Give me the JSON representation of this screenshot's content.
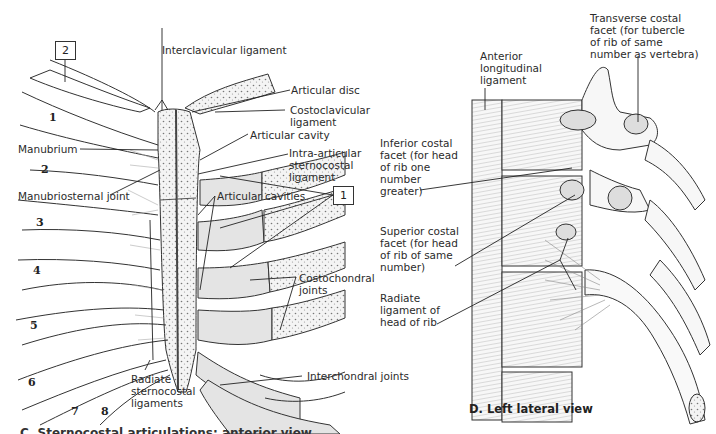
{
  "figure": {
    "left_panel": {
      "boxes": [
        {
          "id": "box-2",
          "text": "2"
        },
        {
          "id": "box-1",
          "text": "1"
        }
      ],
      "rib_numbers": [
        "1",
        "2",
        "3",
        "4",
        "5",
        "6",
        "7",
        "8"
      ],
      "labels": {
        "interclavicular_ligament": "Interclavicular ligament",
        "articular_disc": "Articular disc",
        "costoclavicular_ligament": [
          "Costoclavicular",
          "ligament"
        ],
        "articular_cavity": "Articular cavity",
        "intra_articular_ligament": [
          "Intra-articular",
          "sternocostal",
          "ligament"
        ],
        "manubrium": "Manubrium",
        "manubriosternal_joint": "Manubriosternal joint",
        "articular_cavities": "Articular cavities",
        "costochondral_joints": [
          "Costochondral",
          "joints"
        ],
        "radiate_sternocostal_ligaments": [
          "Radiate",
          "sternocostal",
          "ligaments"
        ],
        "interchondral_joints": "Interchondral joints"
      },
      "caption_clipped": "C. Sternocostal articulations: anterior view"
    },
    "right_panel": {
      "labels": {
        "transverse_costal_facet": [
          "Transverse costal",
          "facet (for tubercle",
          "of rib of same",
          "number as vertebra)"
        ],
        "anterior_longitudinal_ligament": [
          "Anterior",
          "longitudinal",
          "ligament"
        ],
        "inferior_costal_facet": [
          "Inferior costal",
          "facet (for head",
          "of rib one",
          "number",
          "greater)"
        ],
        "superior_costal_facet": [
          "Superior costal",
          "facet (for head",
          "of rib of same",
          "number)"
        ],
        "radiate_ligament": [
          "Radiate",
          "ligament of",
          "head of rib"
        ]
      },
      "caption": "D. Left lateral view"
    },
    "colors": {
      "cartilage_fill": "#e4e4e4",
      "line": "#2a2a2a",
      "bone_stipple": "#7a7a7a"
    }
  }
}
